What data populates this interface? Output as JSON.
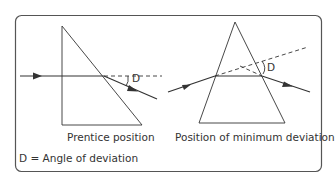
{
  "captions": {
    "left": "Prentice position",
    "right": "Position of minimum deviation",
    "legend": "D = Angle of deviation"
  },
  "angle_labels": {
    "left": "D",
    "right": "D"
  },
  "colors": {
    "stroke": "#333333",
    "border": "#555555",
    "background": "#ffffff"
  }
}
